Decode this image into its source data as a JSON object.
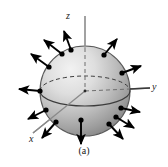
{
  "figure": {
    "caption": "(a)",
    "background_color": "#ffffff",
    "axes": [
      {
        "name": "z",
        "label": "z",
        "direction": "up"
      },
      {
        "name": "y",
        "label": "y",
        "direction": "right"
      },
      {
        "name": "x",
        "label": "x",
        "direction": "lower-left"
      }
    ],
    "sphere": {
      "center": {
        "x": 85,
        "y": 91
      },
      "radius": 45,
      "fill_light": "#e6e6e6",
      "fill_dark": "#8f8f8f",
      "outline_color": "#4a4a4a",
      "equator_front_style": "solid",
      "equator_back_style": "dashed"
    },
    "vectors": {
      "count": 12,
      "description": "outward normal vectors",
      "color": "#000000",
      "dot_color": "#000000",
      "dot_radius": 2.6,
      "length": 22,
      "angles_deg": [
        270,
        300,
        330,
        0,
        30,
        60,
        90,
        120,
        150,
        180,
        210,
        240
      ]
    },
    "axis_line_color": "#808080",
    "colors": {
      "ink": "#1a1a1a",
      "axis": "#808080",
      "arrow": "#000000"
    }
  }
}
